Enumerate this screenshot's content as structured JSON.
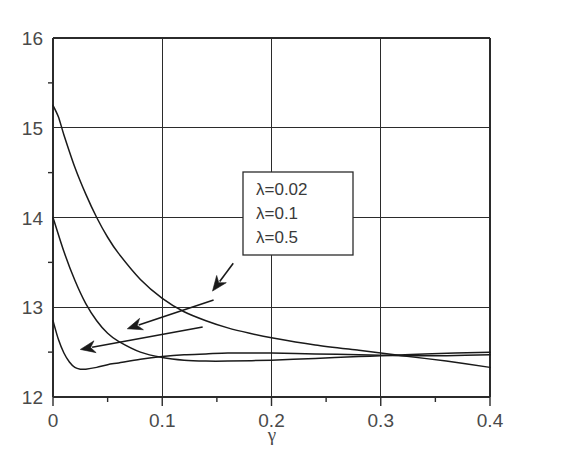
{
  "chart_data": {
    "type": "line",
    "title": "",
    "xlabel": "γ",
    "ylabel": "",
    "xlim": [
      0,
      0.4
    ],
    "ylim": [
      12,
      16
    ],
    "grid": true,
    "legend_position": "center",
    "x_ticks": [
      "0",
      "0.1",
      "0.2",
      "0.3",
      "0.4"
    ],
    "x_tick_values": [
      0,
      0.1,
      0.2,
      0.3,
      0.4
    ],
    "x_minor_ticks": [
      0.05,
      0.15,
      0.25,
      0.35
    ],
    "y_ticks": [
      "12",
      "13",
      "14",
      "15",
      "16"
    ],
    "y_tick_values": [
      12,
      13,
      14,
      15,
      16
    ],
    "y_minor_ticks": [
      12.5,
      13.5,
      14.5,
      15.5
    ],
    "series": [
      {
        "name": "λ=0.02",
        "x": [
          0.0,
          0.005,
          0.01,
          0.02,
          0.03,
          0.04,
          0.05,
          0.06,
          0.08,
          0.1,
          0.12,
          0.14,
          0.16,
          0.18,
          0.2,
          0.24,
          0.28,
          0.3,
          0.32,
          0.36,
          0.4
        ],
        "y": [
          15.25,
          15.12,
          14.92,
          14.56,
          14.26,
          14.0,
          13.78,
          13.6,
          13.31,
          13.1,
          12.95,
          12.85,
          12.77,
          12.71,
          12.66,
          12.58,
          12.52,
          12.49,
          12.46,
          12.4,
          12.33
        ]
      },
      {
        "name": "λ=0.1",
        "x": [
          0.0,
          0.01,
          0.02,
          0.03,
          0.04,
          0.05,
          0.06,
          0.08,
          0.1,
          0.12,
          0.14,
          0.16,
          0.2,
          0.24,
          0.28,
          0.3,
          0.34,
          0.4
        ],
        "y": [
          14.0,
          13.62,
          13.3,
          13.04,
          12.85,
          12.71,
          12.62,
          12.5,
          12.44,
          12.41,
          12.4,
          12.4,
          12.41,
          12.43,
          12.45,
          12.46,
          12.48,
          12.5
        ]
      },
      {
        "name": "λ=0.5",
        "x": [
          0.0,
          0.005,
          0.01,
          0.015,
          0.02,
          0.025,
          0.03,
          0.04,
          0.05,
          0.06,
          0.08,
          0.1,
          0.12,
          0.14,
          0.16,
          0.18,
          0.2,
          0.24,
          0.28,
          0.32,
          0.36,
          0.4
        ],
        "y": [
          12.85,
          12.64,
          12.49,
          12.39,
          12.33,
          12.31,
          12.31,
          12.33,
          12.36,
          12.38,
          12.42,
          12.45,
          12.47,
          12.48,
          12.49,
          12.49,
          12.49,
          12.48,
          12.47,
          12.46,
          12.46,
          12.47
        ]
      }
    ],
    "annotations": [
      {
        "label": "λ=0.02",
        "arrow_from": [
          0.165,
          13.49
        ],
        "arrow_to": [
          0.146,
          13.18
        ]
      },
      {
        "label": "λ=0.1",
        "arrow_from": [
          0.147,
          13.08
        ],
        "arrow_to": [
          0.068,
          12.76
        ]
      },
      {
        "label": "λ=0.5",
        "arrow_from": [
          0.137,
          12.78
        ],
        "arrow_to": [
          0.025,
          12.53
        ]
      }
    ]
  },
  "legend": {
    "entries": [
      {
        "label": "λ=0.02"
      },
      {
        "label": "λ=0.1"
      },
      {
        "label": "λ=0.5"
      }
    ]
  },
  "axes": {
    "x_label": "γ",
    "x_tick_labels": [
      "0",
      "0.1",
      "0.2",
      "0.3",
      "0.4"
    ],
    "y_tick_labels": [
      "16",
      "15",
      "14",
      "13",
      "12"
    ]
  },
  "colors": {
    "curve": "#1a1a1a",
    "axis": "#2b2b2b",
    "grid": "#2b2b2b",
    "text": "#4a4a4a",
    "background": "#ffffff"
  }
}
